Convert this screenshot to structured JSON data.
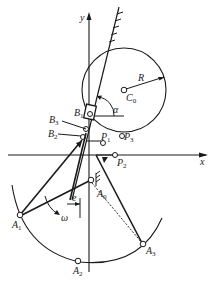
{
  "diagram": {
    "type": "mechanism-synthesis-diagram",
    "axes": {
      "x_label": "x",
      "y_label": "y"
    },
    "circle": {
      "center_label": "C",
      "center_sub": "0",
      "radius_label": "R"
    },
    "angle_label": "α",
    "points": [
      {
        "label": "B",
        "sub": "1"
      },
      {
        "label": "B",
        "sub": "2"
      },
      {
        "label": "B",
        "sub": "3"
      },
      {
        "label": "P",
        "sub": "1"
      },
      {
        "label": "P",
        "sub": "2"
      },
      {
        "label": "P",
        "sub": "3"
      },
      {
        "label": "A",
        "sub": "0"
      },
      {
        "label": "A",
        "sub": "1"
      },
      {
        "label": "A",
        "sub": "2"
      },
      {
        "label": "A",
        "sub": "3"
      }
    ],
    "rotation_label": "ω",
    "offset_label": "e"
  }
}
